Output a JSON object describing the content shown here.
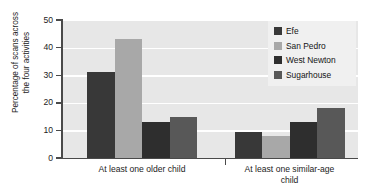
{
  "chart_data": {
    "type": "bar",
    "title": "",
    "xlabel": "",
    "ylabel": "Percentage of scans across\nthe four activities",
    "ylim": [
      0,
      50
    ],
    "yticks": [
      0,
      10,
      20,
      30,
      40,
      50
    ],
    "ytick_labels": [
      "0",
      "10",
      "20",
      "30",
      "40",
      "50"
    ],
    "grid": true,
    "grid_axis": "y",
    "legend_position": "top-right",
    "categories": [
      "At least one older child",
      "At least one similar-age\nchild"
    ],
    "series": [
      {
        "name": "Efe",
        "color": "#383838",
        "values": [
          31,
          9.5
        ]
      },
      {
        "name": "San Pedro",
        "color": "#a8a8a8",
        "values": [
          43,
          8
        ]
      },
      {
        "name": "West Newton",
        "color": "#2e2e2e",
        "values": [
          13,
          13
        ]
      },
      {
        "name": "Sugarhouse",
        "color": "#585858",
        "values": [
          15,
          18
        ]
      }
    ]
  },
  "legend": {
    "items": [
      {
        "label": "Efe",
        "swatch": "#383838"
      },
      {
        "label": "San Pedro",
        "swatch": "#a8a8a8"
      },
      {
        "label": "West Newton",
        "swatch": "#2e2e2e"
      },
      {
        "label": "Sugarhouse",
        "swatch": "#585858"
      }
    ]
  },
  "axes": {
    "y_title": "Percentage of scans across\nthe four activities",
    "y_tick_labels": [
      "0",
      "10",
      "20",
      "30",
      "40",
      "50"
    ],
    "x_tick_labels": [
      "At least one older child",
      "At least one similar-age\nchild"
    ]
  },
  "colors": {
    "plot_background": "#e7e7e7",
    "gridline": "#ffffff",
    "axis": "#4a4a4a",
    "legend_background": "#f0f0f0",
    "text": "#1c1c1c"
  }
}
